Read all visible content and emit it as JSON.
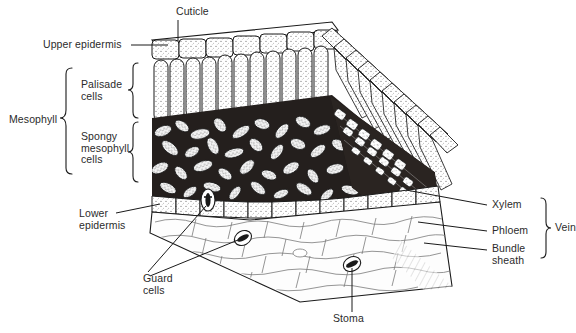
{
  "diagram": {
    "style": "black-and-white line engraving",
    "background_color": "#ffffff",
    "ink_color": "#1a1a1a",
    "text_color": "#2b2b2b"
  },
  "labels": {
    "cuticle": "Cuticle",
    "upper_epidermis": "Upper epidermis",
    "mesophyll": "Mesophyll",
    "palisade_cells": "Palisade\ncells",
    "spongy_mesophyll_cells": "Spongy\nmesophyll\ncells",
    "lower_epidermis": "Lower\nepidermis",
    "guard_cells": "Guard\ncells",
    "stoma": "Stoma",
    "xylem": "Xylem",
    "phloem": "Phloem",
    "bundle_sheath": "Bundle\nsheath",
    "vein": "Vein"
  },
  "braces": {
    "mesophyll_group": [
      "Palisade cells",
      "Spongy mesophyll cells"
    ],
    "vein_group": [
      "Xylem",
      "Phloem",
      "Bundle sheath"
    ]
  },
  "structures": [
    {
      "name": "cuticle",
      "description": "thin waxy layer on top surface"
    },
    {
      "name": "upper-epidermis",
      "description": "single row of rectangular cells below cuticle"
    },
    {
      "name": "palisade-layer",
      "description": "tall columnar cells packed vertically"
    },
    {
      "name": "spongy-mesophyll",
      "description": "irregular loosely packed cells with air spaces"
    },
    {
      "name": "lower-epidermis",
      "description": "single row of cells on the underside"
    },
    {
      "name": "vascular-bundle",
      "description": "vein containing xylem, phloem and bundle sheath"
    },
    {
      "name": "stomata",
      "description": "pores in lower epidermis flanked by guard cells"
    }
  ]
}
